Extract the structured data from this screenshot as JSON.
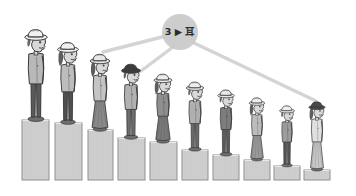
{
  "illustration": {
    "title": "Cartoon figures standing on descending pedestals",
    "background_color": "#ffffff",
    "style": "grayscale hand-drawn cartoon",
    "width": 356,
    "height": 196
  },
  "node": {
    "shape": "circle",
    "label": "3 ▶ 耳",
    "label_number": "3",
    "label_arrow": "▶",
    "label_glyph": "耳",
    "fill_color": "#c9c9c9",
    "text_color": "#2b2b2b",
    "center_x": 180,
    "center_y": 32,
    "radius": 18
  },
  "connectors": {
    "color": "#d2d2d2",
    "lines": [
      {
        "name": "connector-to-figure-3",
        "x1": 166,
        "y1": 36,
        "x2": 103,
        "y2": 52
      },
      {
        "name": "connector-to-figure-4",
        "x1": 173,
        "y1": 47,
        "x2": 141,
        "y2": 71
      },
      {
        "name": "connector-to-figure-10",
        "x1": 194,
        "y1": 43,
        "x2": 316,
        "y2": 101
      }
    ]
  },
  "chart_data": {
    "type": "bar",
    "xlabel": "",
    "ylabel": "Pedestal height",
    "ylim": [
      0,
      62
    ],
    "grid": false,
    "legend": false,
    "categories": [
      "1",
      "2",
      "3",
      "4",
      "5",
      "6",
      "7",
      "8",
      "9",
      "10"
    ],
    "values": [
      60,
      57,
      50,
      42,
      38,
      30,
      25,
      20,
      14,
      10
    ],
    "bars": [
      {
        "index": 1,
        "x": 22,
        "width": 27,
        "top": 120,
        "height": 60,
        "fill": "#cfcfcf"
      },
      {
        "index": 2,
        "x": 55,
        "width": 27,
        "top": 123,
        "height": 57,
        "fill": "#cfcfcf"
      },
      {
        "index": 3,
        "x": 88,
        "width": 25,
        "top": 130,
        "height": 50,
        "fill": "#cfcfcf"
      },
      {
        "index": 4,
        "x": 118,
        "width": 27,
        "top": 138,
        "height": 42,
        "fill": "#cfcfcf"
      },
      {
        "index": 5,
        "x": 150,
        "width": 27,
        "top": 142,
        "height": 38,
        "fill": "#cfcfcf"
      },
      {
        "index": 6,
        "x": 182,
        "width": 26,
        "top": 150,
        "height": 30,
        "fill": "#cfcfcf"
      },
      {
        "index": 7,
        "x": 213,
        "width": 26,
        "top": 155,
        "height": 25,
        "fill": "#cfcfcf"
      },
      {
        "index": 8,
        "x": 244,
        "width": 26,
        "top": 160,
        "height": 20,
        "fill": "#cfcfcf"
      },
      {
        "index": 9,
        "x": 274,
        "width": 26,
        "top": 166,
        "height": 14,
        "fill": "#cfcfcf"
      },
      {
        "index": 10,
        "x": 304,
        "width": 26,
        "top": 170,
        "height": 10,
        "fill": "#cfcfcf"
      }
    ],
    "baseline_y": 180
  },
  "figures": [
    {
      "index": 1,
      "name": "figure-1",
      "hat": "white-fedora",
      "hat_color": "#f2f2f2",
      "body_color": "#b8b8b8",
      "lower_color": "#5a5a5a",
      "cx": 36,
      "top": 27,
      "height": 93,
      "scale": 1.0
    },
    {
      "index": 2,
      "name": "figure-2",
      "hat": "white-fedora",
      "hat_color": "#f0f0f0",
      "body_color": "#bdbdbd",
      "lower_color": "#4f4f4f",
      "cx": 68,
      "top": 40,
      "height": 83,
      "scale": 0.93
    },
    {
      "index": 3,
      "name": "figure-3",
      "hat": "striped-fedora",
      "hat_color": "#e6e6e6",
      "body_color": "#c4c4c4",
      "lower_color": "#8a8a8a",
      "cx": 100,
      "top": 52,
      "height": 78,
      "scale": 0.88
    },
    {
      "index": 4,
      "name": "figure-4",
      "hat": "dark-fedora",
      "hat_color": "#3c3c3c",
      "body_color": "#b2b2b2",
      "lower_color": "#6f6f6f",
      "cx": 131,
      "top": 62,
      "height": 76,
      "scale": 0.85
    },
    {
      "index": 5,
      "name": "figure-5",
      "hat": "white-fedora",
      "hat_color": "#ededed",
      "body_color": "#8f8f8f",
      "lower_color": "#7a7a7a",
      "cx": 163,
      "top": 72,
      "height": 70,
      "scale": 0.8
    },
    {
      "index": 6,
      "name": "figure-6",
      "hat": "white-fedora",
      "hat_color": "#ececec",
      "body_color": "#b0b0b0",
      "lower_color": "#6a6a6a",
      "cx": 195,
      "top": 80,
      "height": 70,
      "scale": 0.78
    },
    {
      "index": 7,
      "name": "figure-7",
      "hat": "white-fedora",
      "hat_color": "#e9e9e9",
      "body_color": "#7d7d7d",
      "lower_color": "#5c5c5c",
      "cx": 226,
      "top": 88,
      "height": 67,
      "scale": 0.74
    },
    {
      "index": 8,
      "name": "figure-8",
      "hat": "white-fedora",
      "hat_color": "#ededed",
      "body_color": "#bcbcbc",
      "lower_color": "#9a9a9a",
      "cx": 257,
      "top": 96,
      "height": 64,
      "scale": 0.7
    },
    {
      "index": 9,
      "name": "figure-9",
      "hat": "white-fedora",
      "hat_color": "#efefef",
      "body_color": "#9c9c9c",
      "lower_color": "#555555",
      "cx": 287,
      "top": 104,
      "height": 62,
      "scale": 0.67
    },
    {
      "index": 10,
      "name": "figure-10",
      "hat": "dark-fedora",
      "hat_color": "#4a4a4a",
      "body_color": "#e0e0e0",
      "lower_color": "#c8c8c8",
      "cx": 317,
      "top": 100,
      "height": 70,
      "scale": 0.72
    }
  ],
  "palette": {
    "ink": "#3a3a3a",
    "pedestal_fill": "#cfcfcf",
    "pedestal_stroke": "#8f8f8f",
    "connector": "#d2d2d2",
    "node_fill": "#c9c9c9",
    "skin": "#d8d8d8",
    "background": "#ffffff"
  }
}
